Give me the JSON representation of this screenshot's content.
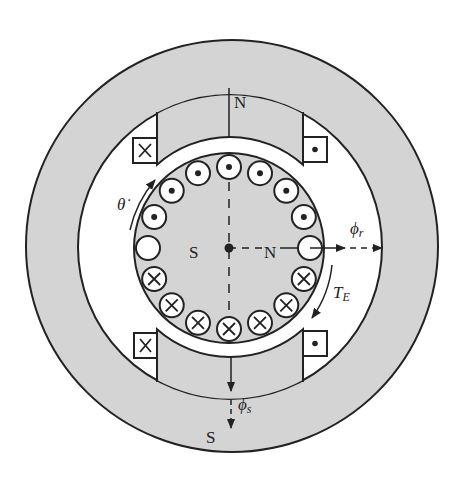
{
  "diagram": {
    "colors": {
      "iron": "#d4d4d4",
      "air": "#ffffff",
      "stroke": "#222222"
    },
    "labels": {
      "stator_top_pole": "N",
      "stator_bottom_pole": "S",
      "rotor_left_pole": "S",
      "rotor_right_pole": "N",
      "rotor_speed": "θ̇",
      "rotor_flux_symbol": "ϕ",
      "rotor_flux_sub": "r",
      "stator_flux_symbol": "ϕ",
      "stator_flux_sub": "s",
      "torque_symbol": "T",
      "torque_sub": "E"
    },
    "field_coils": [
      {
        "position": "top-left",
        "current": "into-page"
      },
      {
        "position": "top-right",
        "current": "out-of-page"
      },
      {
        "position": "bottom-left",
        "current": "into-page"
      },
      {
        "position": "bottom-right",
        "current": "out-of-page"
      }
    ],
    "rotor_conductors": {
      "count": 16,
      "pattern_from_right_counterclockwise": [
        "empty",
        "dot",
        "dot",
        "dot",
        "dot",
        "dot",
        "dot",
        "dot",
        "empty",
        "cross",
        "cross",
        "cross",
        "cross",
        "cross",
        "cross",
        "cross"
      ]
    }
  }
}
